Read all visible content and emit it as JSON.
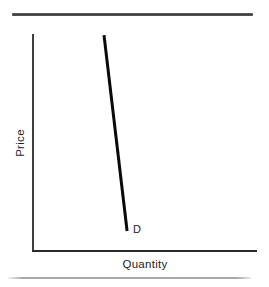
{
  "chart": {
    "ylabel": "Price",
    "xlabel": "Quantity",
    "curve_label": "D"
  },
  "chart_data": {
    "type": "line",
    "title": "",
    "xlabel": "Quantity",
    "ylabel": "Price",
    "axis_tick_labels": [],
    "grid": false,
    "legend": false,
    "series": [
      {
        "name": "D",
        "description": "steep downward-sloping demand curve, no numeric scale shown",
        "points_rel": [
          [
            0.317,
            0.995
          ],
          [
            0.42,
            0.092
          ]
        ]
      }
    ]
  },
  "colors": {
    "background": "#ffffff",
    "axis": "#2b2b2b",
    "curve": "#0a0a0a",
    "top_rule": "#3c3c3c",
    "bottom_rule": "#a8a8a8",
    "text": "#242424"
  }
}
